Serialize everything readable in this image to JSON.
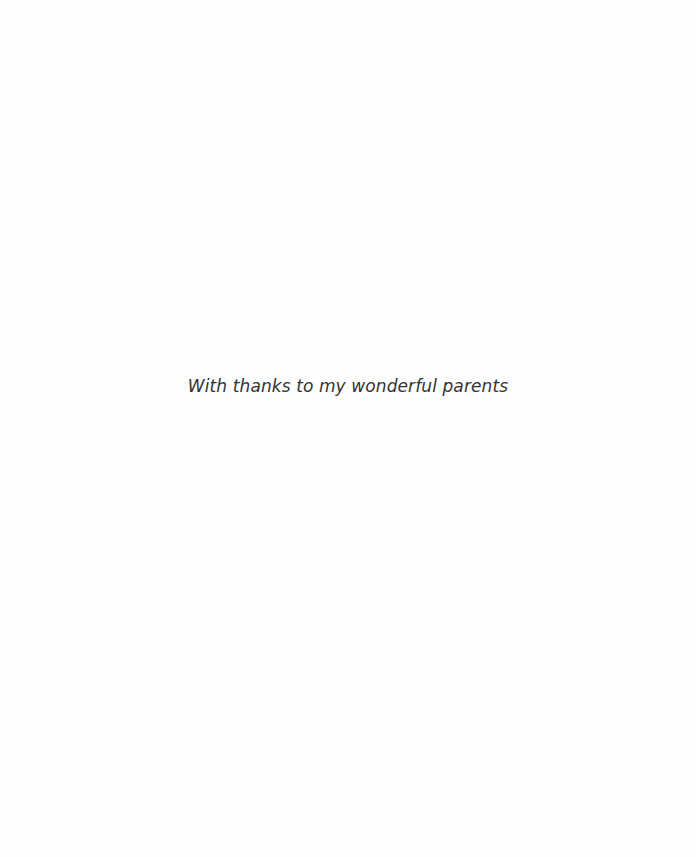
{
  "page": {
    "dedication": "With thanks to my wonderful parents",
    "background_color": "#fefefe",
    "text_color": "#333333"
  }
}
